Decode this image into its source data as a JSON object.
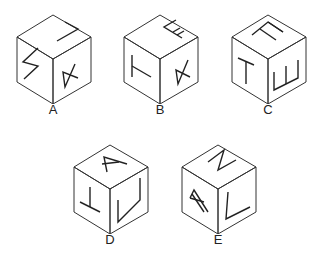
{
  "figure": {
    "type": "cube-folding-options",
    "stroke_color": "#333333",
    "background": "#ffffff"
  },
  "options": [
    {
      "label": "A",
      "faces": {
        "top": "L (rotated)",
        "left": "Z (rotated)",
        "right": "A (rotated)"
      }
    },
    {
      "label": "B",
      "faces": {
        "top": "E (rotated)",
        "left": "T (rotated)",
        "right": "A (rotated)"
      }
    },
    {
      "label": "C",
      "faces": {
        "top": "E (rotated)",
        "left": "T",
        "right": "E (rotated)"
      }
    },
    {
      "label": "D",
      "faces": {
        "top": "A (rotated)",
        "left": "T (inverted)",
        "right": "Z (rotated)"
      }
    },
    {
      "label": "E",
      "faces": {
        "top": "Z (rotated)",
        "left": "A (rotated)",
        "right": "L (rotated)"
      }
    }
  ]
}
